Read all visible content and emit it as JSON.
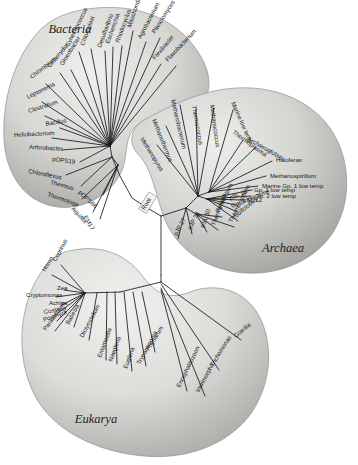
{
  "figure": {
    "type": "unrooted-phylogenetic-tree",
    "root_label": "Root",
    "background_color": "#ffffff",
    "blob_fill_light": "#e7e7e5",
    "blob_fill_dark": "#a9a9a6",
    "branch_color": "#16181c",
    "text_color": "#14161a"
  },
  "domains": [
    {
      "key": "bacteria",
      "label": "Bacteria",
      "label_x": 70,
      "label_y": 33
    },
    {
      "key": "archaea",
      "label": "Archaea",
      "label_x": 283,
      "label_y": 252
    },
    {
      "key": "eukarya",
      "label": "Eukarya",
      "label_x": 96,
      "label_y": 423
    }
  ],
  "bacteria_taxa": [
    {
      "name": "Mitochondrion",
      "lx": 131,
      "ly": 28,
      "rot": -72,
      "tx": 120,
      "ty": 140
    },
    {
      "name": "Rhodocyclus",
      "lx": 119,
      "ly": 43,
      "rot": -70,
      "tx": 118,
      "ty": 141
    },
    {
      "name": "Escherichia",
      "lx": 109,
      "ly": 44,
      "rot": -70,
      "tx": 116,
      "ty": 142
    },
    {
      "name": "Desulfovibrio",
      "lx": 101,
      "ly": 48,
      "rot": -70,
      "tx": 114,
      "ty": 143
    },
    {
      "name": "Agrobacterium",
      "lx": 141,
      "ly": 39,
      "rot": -62,
      "tx": 122,
      "ty": 139
    },
    {
      "name": "Planctomyces",
      "lx": 155,
      "ly": 34,
      "rot": -58,
      "tx": 124,
      "ty": 139
    },
    {
      "name": "Flexibacter",
      "lx": 155,
      "ly": 60,
      "rot": -50,
      "tx": 124,
      "ty": 141
    },
    {
      "name": "Flavobacterium",
      "lx": 168,
      "ly": 62,
      "rot": -47,
      "tx": 126,
      "ty": 142
    },
    {
      "name": "Chloroplast",
      "lx": 84,
      "ly": 46,
      "rot": -70,
      "tx": 111,
      "ty": 144
    },
    {
      "name": "Synechococcus",
      "lx": 69,
      "ly": 47,
      "rot": -64,
      "tx": 109,
      "ty": 145
    },
    {
      "name": "Gloeobacter",
      "lx": 63,
      "ly": 66,
      "rot": -58,
      "tx": 108,
      "ty": 146
    },
    {
      "name": "Chlamydia",
      "lx": 50,
      "ly": 68,
      "rot": -50,
      "tx": 107,
      "ty": 147
    },
    {
      "name": "Chlorobium",
      "lx": 32,
      "ly": 79,
      "rot": -38,
      "tx": 106,
      "ty": 148
    },
    {
      "name": "Leptonema",
      "lx": 28,
      "ly": 99,
      "rot": -26,
      "tx": 105,
      "ty": 149
    },
    {
      "name": "Clostridium",
      "lx": 29,
      "ly": 113,
      "rot": -18,
      "tx": 105,
      "ty": 150
    },
    {
      "name": "Bacillus",
      "lx": 46,
      "ly": 126,
      "rot": -10,
      "tx": 105,
      "ty": 151
    },
    {
      "name": "Heliobacterium",
      "lx": 14,
      "ly": 137,
      "rot": -3,
      "tx": 105,
      "ty": 152
    },
    {
      "name": "Arthrobacter",
      "lx": 29,
      "ly": 149,
      "rot": 3,
      "tx": 105,
      "ty": 153
    },
    {
      "name": "pOPS19",
      "lx": 52,
      "ly": 161,
      "rot": 7,
      "tx": 106,
      "ty": 154
    },
    {
      "name": "Chloroflexus",
      "lx": 28,
      "ly": 173,
      "rot": 11,
      "tx": 107,
      "ty": 155
    },
    {
      "name": "Thermus",
      "lx": 50,
      "ly": 184,
      "rot": 15,
      "tx": 108,
      "ty": 157
    },
    {
      "name": "Thermotoga",
      "lx": 47,
      "ly": 196,
      "rot": 19,
      "tx": 110,
      "ty": 158
    },
    {
      "name": "pOPS66",
      "lx": 78,
      "ly": 193,
      "rot": 42,
      "tx": 113,
      "ty": 160
    },
    {
      "name": "Aquifex",
      "lx": 71,
      "ly": 209,
      "rot": 48,
      "tx": 115,
      "ty": 162
    },
    {
      "name": "EM17",
      "lx": 83,
      "ly": 217,
      "rot": 58,
      "tx": 118,
      "ty": 164
    }
  ],
  "archaea_taxa": [
    {
      "name": "Methanopyrus",
      "lx": 140,
      "ly": 139,
      "rot": 58,
      "tx": 200,
      "ty": 192
    },
    {
      "name": "Methanothermus",
      "lx": 152,
      "ly": 120,
      "rot": 68,
      "tx": 201,
      "ty": 190
    },
    {
      "name": "Methanobacterium",
      "lx": 171,
      "ly": 100,
      "rot": 77,
      "tx": 203,
      "ty": 189
    },
    {
      "name": "Thermococcus",
      "lx": 192,
      "ly": 106,
      "rot": 80,
      "tx": 205,
      "ty": 188
    },
    {
      "name": "Methanococcus",
      "lx": 210,
      "ly": 105,
      "rot": 82,
      "tx": 207,
      "ty": 188
    },
    {
      "name": "Marine low temp",
      "lx": 231,
      "ly": 103,
      "rot": 66,
      "tx": 209,
      "ty": 188
    },
    {
      "name": "Thermoplasma",
      "lx": 232,
      "ly": 133,
      "rot": 36,
      "tx": 210,
      "ty": 189
    },
    {
      "name": "Archaeoglobus",
      "lx": 247,
      "ly": 140,
      "rot": 30,
      "tx": 211,
      "ty": 190
    },
    {
      "name": "Haloferax",
      "lx": 276,
      "ly": 162,
      "rot": 0,
      "tx": 212,
      "ty": 191
    },
    {
      "name": "Methanospirillum",
      "lx": 270,
      "ly": 178,
      "rot": 0,
      "tx": 212,
      "ty": 192
    },
    {
      "name": "Marine Gp. 1 low temp",
      "lx": 262,
      "ly": 188,
      "rot": 0,
      "tx": 212,
      "ty": 193
    },
    {
      "name": "Gp. 2 low temp",
      "lx": 255,
      "ly": 198,
      "rot": 0,
      "tx": 211,
      "ty": 194
    },
    {
      "name": "Gp. 1 low temp",
      "lx": 254,
      "ly": 192,
      "rot": 0,
      "tx": 211,
      "ty": 194
    },
    {
      "name": "pSL 12",
      "lx": 243,
      "ly": 202,
      "rot": 0,
      "tx": 210,
      "ty": 195
    },
    {
      "name": "pSL 22",
      "lx": 230,
      "ly": 200,
      "rot": -22,
      "tx": 209,
      "ty": 195
    },
    {
      "name": "Gp. 3 low temp",
      "lx": 232,
      "ly": 208,
      "rot": -22,
      "tx": 208,
      "ty": 196
    },
    {
      "name": "Sulfolobus",
      "lx": 236,
      "ly": 218,
      "rot": -40,
      "tx": 207,
      "ty": 197
    },
    {
      "name": "Pyrodictium",
      "lx": 219,
      "ly": 213,
      "rot": -64,
      "tx": 205,
      "ty": 198
    },
    {
      "name": "Thermoproteus",
      "lx": 232,
      "ly": 223,
      "rot": -64,
      "tx": 204,
      "ty": 199
    },
    {
      "name": "Thermofilum",
      "lx": 215,
      "ly": 226,
      "rot": -70,
      "tx": 202,
      "ty": 200
    },
    {
      "name": "pSL 50",
      "lx": 204,
      "ly": 228,
      "rot": -70,
      "tx": 200,
      "ty": 201
    },
    {
      "name": "pJP 78",
      "lx": 191,
      "ly": 230,
      "rot": -62,
      "tx": 186,
      "ty": 208
    },
    {
      "name": "pJP 27",
      "lx": 177,
      "ly": 236,
      "rot": -62,
      "tx": 178,
      "ty": 212
    }
  ],
  "eukarya_taxa": [
    {
      "name": "Coprinus",
      "lx": 56,
      "ly": 262,
      "rot": -62,
      "tx": 85,
      "ty": 293
    },
    {
      "name": "Homo",
      "lx": 45,
      "ly": 272,
      "rot": -58,
      "tx": 85,
      "ty": 293
    },
    {
      "name": "Zea",
      "lx": 57,
      "ly": 290,
      "rot": 0,
      "tx": 85,
      "ty": 293
    },
    {
      "name": "Cryptomonas",
      "lx": 26,
      "ly": 297,
      "rot": 0,
      "tx": 85,
      "ty": 294
    },
    {
      "name": "Achlya",
      "lx": 49,
      "ly": 305,
      "rot": 0,
      "tx": 85,
      "ty": 295
    },
    {
      "name": "Costaria",
      "lx": 44,
      "ly": 314,
      "rot": -10,
      "tx": 85,
      "ty": 296
    },
    {
      "name": "Porphyra",
      "lx": 44,
      "ly": 322,
      "rot": -20,
      "tx": 85,
      "ty": 297
    },
    {
      "name": "Paramecium",
      "lx": 46,
      "ly": 331,
      "rot": -55,
      "tx": 86,
      "ty": 298
    },
    {
      "name": "Babesia",
      "lx": 69,
      "ly": 325,
      "rot": -62,
      "tx": 88,
      "ty": 299
    },
    {
      "name": "Dictyostelium",
      "lx": 83,
      "ly": 338,
      "rot": -62,
      "tx": 97,
      "ty": 294
    },
    {
      "name": "Entamoeba",
      "lx": 101,
      "ly": 358,
      "rot": -70,
      "tx": 106,
      "ty": 292
    },
    {
      "name": "Naegleria",
      "lx": 112,
      "ly": 362,
      "rot": -70,
      "tx": 114,
      "ty": 292
    },
    {
      "name": "Euglena",
      "lx": 127,
      "ly": 369,
      "rot": -70,
      "tx": 123,
      "ty": 292
    },
    {
      "name": "Trypanosoma",
      "lx": 140,
      "ly": 365,
      "rot": -62,
      "tx": 132,
      "ty": 293
    },
    {
      "name": "Physarum",
      "lx": 149,
      "ly": 351,
      "rot": -58,
      "tx": 141,
      "ty": 294
    },
    {
      "name": "Giardia",
      "lx": 236,
      "ly": 338,
      "rot": -40,
      "tx": 164,
      "ty": 282
    },
    {
      "name": "Trichomonas",
      "lx": 213,
      "ly": 367,
      "rot": -58,
      "tx": 164,
      "ty": 287
    },
    {
      "name": "Vairimorpha",
      "lx": 199,
      "ly": 393,
      "rot": -62,
      "tx": 163,
      "ty": 292
    },
    {
      "name": "Encephalitozoon",
      "lx": 180,
      "ly": 388,
      "rot": -64,
      "tx": 162,
      "ty": 294
    }
  ],
  "counts": {
    "bacteria_total": 25,
    "archaea_total": 23,
    "eukarya_total": 19
  }
}
